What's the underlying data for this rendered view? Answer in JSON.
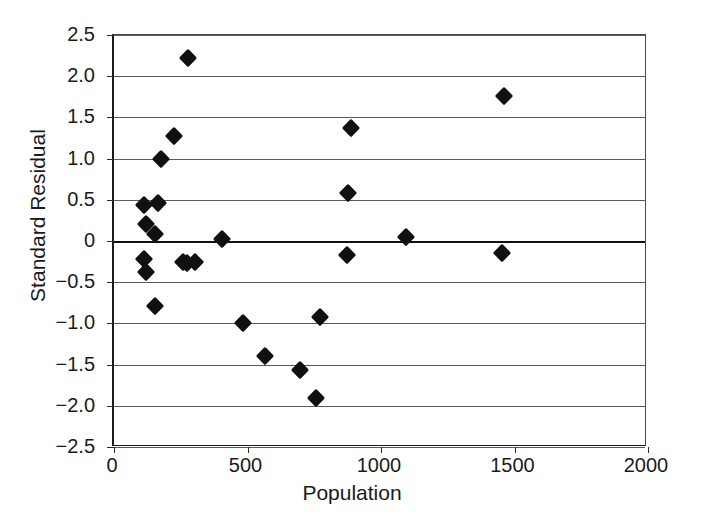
{
  "chart_data": {
    "type": "scatter",
    "title": "",
    "xlabel": "Population",
    "ylabel": "Standard Residual",
    "xlim": [
      0,
      2000
    ],
    "ylim": [
      -2.5,
      2.5
    ],
    "xticks": [
      0,
      500,
      1000,
      1500,
      2000
    ],
    "xtick_labels": [
      "0",
      "500",
      "1000",
      "1500",
      "2000"
    ],
    "yticks": [
      -2.5,
      -2.0,
      -1.5,
      -1.0,
      -0.5,
      0,
      0.5,
      1.0,
      1.5,
      2.0,
      2.5
    ],
    "ytick_labels": [
      "-2.5",
      "-2.0",
      "-1.5",
      "-1.0",
      "-0.5",
      "0",
      "0.5",
      "1.0",
      "1.5",
      "2.0",
      "2.5"
    ],
    "grid": "horizontal",
    "legend": null,
    "marker": "filled-diamond",
    "marker_color": "#101010",
    "reference_line": {
      "y": 0,
      "style": "solid",
      "color": "#111111"
    },
    "points": [
      {
        "x": 112,
        "y": 0.44
      },
      {
        "x": 119,
        "y": 0.21
      },
      {
        "x": 112,
        "y": -0.22
      },
      {
        "x": 119,
        "y": -0.38
      },
      {
        "x": 153,
        "y": -0.79
      },
      {
        "x": 164,
        "y": 0.46
      },
      {
        "x": 153,
        "y": 0.09
      },
      {
        "x": 175,
        "y": 0.99
      },
      {
        "x": 223,
        "y": 1.28
      },
      {
        "x": 279,
        "y": 2.22
      },
      {
        "x": 257,
        "y": -0.26
      },
      {
        "x": 272,
        "y": -0.27
      },
      {
        "x": 302,
        "y": -0.26
      },
      {
        "x": 406,
        "y": 0.02
      },
      {
        "x": 485,
        "y": -1.0
      },
      {
        "x": 564,
        "y": -1.39
      },
      {
        "x": 698,
        "y": -1.56
      },
      {
        "x": 757,
        "y": -1.9
      },
      {
        "x": 772,
        "y": -0.92
      },
      {
        "x": 873,
        "y": -0.17
      },
      {
        "x": 877,
        "y": 0.58
      },
      {
        "x": 888,
        "y": 1.37
      },
      {
        "x": 1093,
        "y": 0.05
      },
      {
        "x": 1455,
        "y": -0.14
      },
      {
        "x": 1459,
        "y": 1.76
      }
    ]
  }
}
